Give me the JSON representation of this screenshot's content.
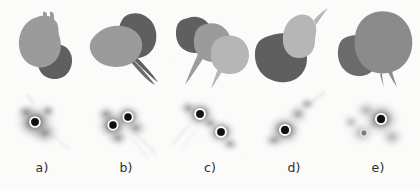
{
  "figure": {
    "caption_labels": [
      "a)",
      "b)",
      "c)",
      "d)",
      "e)"
    ],
    "background_color": "#fbfbfa",
    "rows": {
      "top_label": "segmentation-row",
      "bottom_label": "density-map-row"
    }
  },
  "palette": {
    "blob_light": "#b6b6b6",
    "blob_mid": "#9b9b9b",
    "blob_dark": "#5f5f5f",
    "blob_darker": "#565656",
    "map_hot": "#1a1a1a",
    "map_cool": "#f4f4f4",
    "marker_ring": "#ffffff",
    "marker_core": "#111111",
    "label_color": "#2e2e2e"
  },
  "panels": [
    {
      "id": "a",
      "label": "a)",
      "blob_count": 2,
      "blob_tones": [
        "mid",
        "dark"
      ],
      "marker_count": 1,
      "markers": [
        {
          "x": 0.42,
          "y": 0.44,
          "r": 5.0,
          "emphasis": "strong"
        }
      ],
      "tail_count": 1
    },
    {
      "id": "b",
      "label": "b)",
      "blob_count": 2,
      "blob_tones": [
        "mid",
        "dark"
      ],
      "marker_count": 2,
      "markers": [
        {
          "x": 0.34,
          "y": 0.48,
          "r": 4.8,
          "emphasis": "strong"
        },
        {
          "x": 0.52,
          "y": 0.36,
          "r": 4.8,
          "emphasis": "strong"
        }
      ],
      "tail_count": 2
    },
    {
      "id": "c",
      "label": "c)",
      "blob_count": 3,
      "blob_tones": [
        "dark",
        "mid",
        "light"
      ],
      "marker_count": 2,
      "markers": [
        {
          "x": 0.38,
          "y": 0.32,
          "r": 5.0,
          "emphasis": "strong"
        },
        {
          "x": 0.63,
          "y": 0.58,
          "r": 5.0,
          "emphasis": "strong"
        }
      ],
      "tail_count": 2
    },
    {
      "id": "d",
      "label": "d)",
      "blob_count": 2,
      "blob_tones": [
        "light",
        "dark"
      ],
      "marker_count": 1,
      "markers": [
        {
          "x": 0.4,
          "y": 0.55,
          "r": 5.2,
          "emphasis": "strong"
        }
      ],
      "tail_count": 1
    },
    {
      "id": "e",
      "label": "e)",
      "blob_count": 2,
      "blob_tones": [
        "mid",
        "darker"
      ],
      "marker_count": 2,
      "markers": [
        {
          "x": 0.54,
          "y": 0.4,
          "r": 5.2,
          "emphasis": "strong"
        },
        {
          "x": 0.34,
          "y": 0.6,
          "r": 3.6,
          "emphasis": "faint"
        }
      ],
      "tail_count": 1
    }
  ]
}
